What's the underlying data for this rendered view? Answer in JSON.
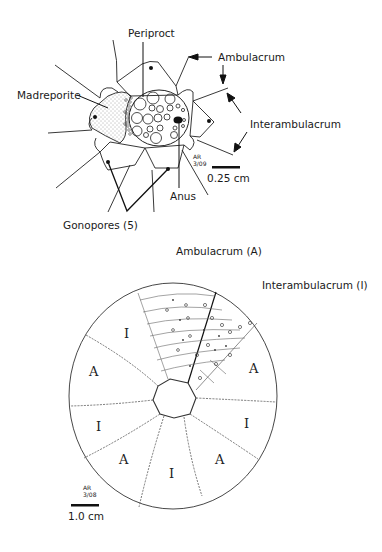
{
  "figure_top": {
    "labels": {
      "periproct": "Periproct",
      "ambulacrum": "Ambulacrum",
      "madreporite": "Madreporite",
      "interambulacrum": "Interambulacrum",
      "anus": "Anus",
      "gonopores": "Gonopores (5)"
    },
    "scale_bar": "0.25 cm",
    "signature": "AR 3/09"
  },
  "figure_bottom": {
    "labels": {
      "ambulacrum": "Ambulacrum (A)",
      "interambulacrum": "Interambulacrum (I)"
    },
    "region_marks": {
      "I_top_left": "I",
      "A_left": "A",
      "A_right": "A",
      "I_left": "I",
      "I_right": "I",
      "A_bottom_left": "A",
      "I_bottom": "I",
      "A_bottom_right": "A"
    },
    "scale_bar": "1.0 cm",
    "signature": "AR 3/08"
  }
}
